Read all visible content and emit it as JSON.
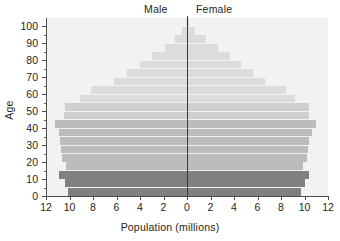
{
  "chart_data": {
    "type": "bar",
    "subtype": "population-pyramid",
    "title": "",
    "xlabel": "Population (millions)",
    "ylabel": "Age",
    "legend_position": "top-center",
    "grid": false,
    "xlim": [
      -12,
      12
    ],
    "ylim": [
      0,
      105
    ],
    "x_ticks": [
      "12",
      "10",
      "8",
      "6",
      "4",
      "2",
      "0",
      "2",
      "4",
      "6",
      "8",
      "10",
      "12"
    ],
    "x_tick_values": [
      -12,
      -10,
      -8,
      -6,
      -4,
      -2,
      0,
      2,
      4,
      6,
      8,
      10,
      12
    ],
    "y_ticks": [
      "0",
      "10",
      "20",
      "30",
      "40",
      "50",
      "60",
      "70",
      "80",
      "90",
      "100"
    ],
    "y_tick_values": [
      0,
      10,
      20,
      30,
      40,
      50,
      60,
      70,
      80,
      90,
      100
    ],
    "y_minor_step": 5,
    "series": [
      {
        "name": "Male",
        "side": "left"
      },
      {
        "name": "Female",
        "side": "right"
      }
    ],
    "categories": [
      "0-4",
      "5-9",
      "10-14",
      "15-19",
      "20-24",
      "25-29",
      "30-34",
      "35-39",
      "40-44",
      "45-49",
      "50-54",
      "55-59",
      "60-64",
      "65-69",
      "70-74",
      "75-79",
      "80-84",
      "85-89",
      "90-94",
      "95-99",
      "100+"
    ],
    "bands": [
      {
        "age_start": 0,
        "age_end": 5,
        "male": 10.1,
        "female": 9.7,
        "shade": "dark"
      },
      {
        "age_start": 5,
        "age_end": 10,
        "male": 10.4,
        "female": 10.0,
        "shade": "dark"
      },
      {
        "age_start": 10,
        "age_end": 15,
        "male": 10.9,
        "female": 10.4,
        "shade": "dark"
      },
      {
        "age_start": 15,
        "age_end": 20,
        "male": 10.3,
        "female": 9.9,
        "shade": "mid"
      },
      {
        "age_start": 20,
        "age_end": 25,
        "male": 10.6,
        "female": 10.2,
        "shade": "mid"
      },
      {
        "age_start": 25,
        "age_end": 30,
        "male": 10.7,
        "female": 10.3,
        "shade": "mid"
      },
      {
        "age_start": 30,
        "age_end": 35,
        "male": 10.8,
        "female": 10.4,
        "shade": "mid"
      },
      {
        "age_start": 35,
        "age_end": 40,
        "male": 10.9,
        "female": 10.6,
        "shade": "mid"
      },
      {
        "age_start": 40,
        "age_end": 45,
        "male": 11.2,
        "female": 11.0,
        "shade": "mid"
      },
      {
        "age_start": 45,
        "age_end": 50,
        "male": 10.5,
        "female": 10.4,
        "shade": "mid-light"
      },
      {
        "age_start": 50,
        "age_end": 55,
        "male": 10.4,
        "female": 10.4,
        "shade": "mid-light"
      },
      {
        "age_start": 55,
        "age_end": 60,
        "male": 9.1,
        "female": 9.2,
        "shade": "light"
      },
      {
        "age_start": 60,
        "age_end": 65,
        "male": 8.2,
        "female": 8.4,
        "shade": "light"
      },
      {
        "age_start": 65,
        "age_end": 70,
        "male": 6.2,
        "female": 6.6,
        "shade": "light"
      },
      {
        "age_start": 70,
        "age_end": 75,
        "male": 5.1,
        "female": 5.6,
        "shade": "light"
      },
      {
        "age_start": 75,
        "age_end": 80,
        "male": 4.0,
        "female": 4.6,
        "shade": "light"
      },
      {
        "age_start": 80,
        "age_end": 85,
        "male": 3.0,
        "female": 3.7,
        "shade": "light"
      },
      {
        "age_start": 85,
        "age_end": 90,
        "male": 1.9,
        "female": 2.6,
        "shade": "light"
      },
      {
        "age_start": 90,
        "age_end": 95,
        "male": 1.0,
        "female": 1.6,
        "shade": "light"
      },
      {
        "age_start": 95,
        "age_end": 100,
        "male": 0.4,
        "female": 0.7,
        "shade": "light"
      },
      {
        "age_start": 100,
        "age_end": 105,
        "male": 0.1,
        "female": 0.2,
        "shade": "light"
      }
    ],
    "colors": {
      "dark": "#808080",
      "mid": "#bcbcbc",
      "mid-light": "#cfcfcf",
      "light": "#dcdcdc",
      "plot_background": "#f2f2f2",
      "axis": "#4d4d4d",
      "center_line": "#3a3a3a",
      "text": "#231f20"
    }
  },
  "labels": {
    "male": "Male",
    "female": "Female",
    "x_axis_title": "Population (millions)",
    "y_axis_title": "Age"
  }
}
